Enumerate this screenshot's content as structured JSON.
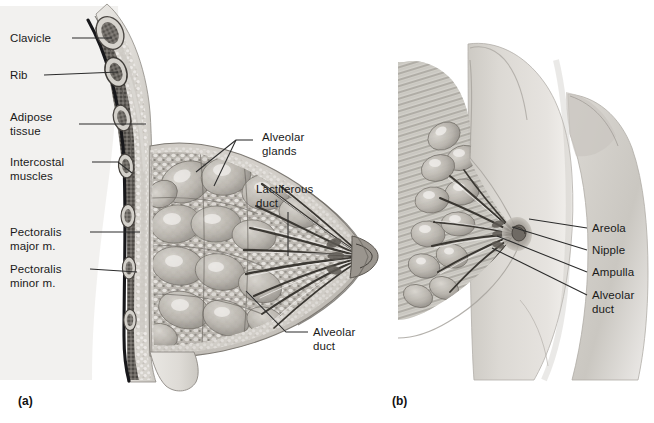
{
  "figure": {
    "background_color": "#ffffff",
    "line_color": "#2b2b2b",
    "text_color": "#1a1a1a",
    "type": "anatomical-illustration"
  },
  "panels": [
    {
      "id": "a",
      "caption": "(a)",
      "view": "sagittal-section",
      "labels": [
        {
          "key": "clavicle",
          "text": "Clavicle"
        },
        {
          "key": "rib",
          "text": "Rib"
        },
        {
          "key": "adipose_tissue",
          "text": "Adipose\ntissue",
          "line1": "Adipose",
          "line2": "tissue"
        },
        {
          "key": "intercostal_muscles",
          "text": "Intercostal\nmuscles",
          "line1": "Intercostal",
          "line2": "muscles"
        },
        {
          "key": "pectoralis_major",
          "text": "Pectoralis\nmajor m.",
          "line1": "Pectoralis",
          "line2": "major m."
        },
        {
          "key": "pectoralis_minor",
          "text": "Pectoralis\nminor m.",
          "line1": "Pectoralis",
          "line2": "minor m."
        },
        {
          "key": "alveolar_glands",
          "text": "Alveolar\nglands",
          "line1": "Alveolar",
          "line2": "glands"
        },
        {
          "key": "lactiferous_duct",
          "text": "Lactiferous\nduct",
          "line1": "Lactiferous",
          "line2": "duct"
        },
        {
          "key": "alveolar_duct",
          "text": "Alveolar\nduct",
          "line1": "Alveolar",
          "line2": "duct"
        }
      ]
    },
    {
      "id": "b",
      "caption": "(b)",
      "view": "anterolateral-cutaway",
      "labels": [
        {
          "key": "areola",
          "text": "Areola"
        },
        {
          "key": "nipple",
          "text": "Nipple"
        },
        {
          "key": "ampulla",
          "text": "Ampulla"
        },
        {
          "key": "alveolar_duct",
          "text": "Alveolar\nduct",
          "line1": "Alveolar",
          "line2": "duct"
        }
      ]
    }
  ]
}
